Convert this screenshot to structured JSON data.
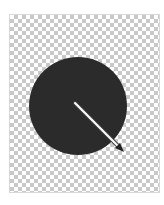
{
  "canvas": {
    "background": "transparent-checkerboard"
  },
  "shape": {
    "type": "circle",
    "fill": "#2b2b2b",
    "cx": 78,
    "cy": 106,
    "r": 49
  },
  "gradient_handle": {
    "type": "arrow",
    "from": [
      75,
      103
    ],
    "to": [
      123,
      151
    ],
    "color": "#ffffff",
    "outline": "#555555"
  }
}
